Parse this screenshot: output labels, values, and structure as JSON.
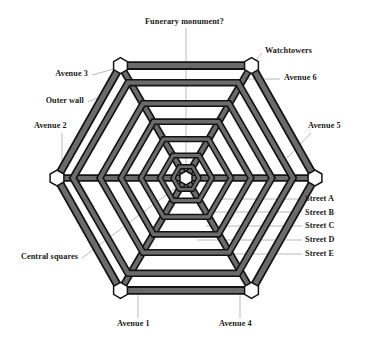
{
  "figure": {
    "type": "radial-hexagonal-city-plan",
    "background_color": "#ffffff",
    "road_fill_color": "#666666",
    "road_edge_color": "#1a1a1a",
    "node_fill_color": "#ffffff",
    "node_edge_color": "#1a1a1a",
    "leader_line_color": "#9a9a9a",
    "text_color": "#1a1a1a"
  },
  "geometry": {
    "center_x": 186,
    "center_y": 178,
    "outer_radius": 129,
    "ring_count": 6,
    "avenue_count": 6,
    "ring_radii": [
      129,
      107,
      86,
      65,
      45,
      26,
      11
    ]
  },
  "labels": {
    "funerary_monument": "Funerary monument?",
    "watchtowers": "Watchtowers",
    "avenue_6": "Avenue 6",
    "avenue_5": "Avenue 5",
    "avenue_3": "Avenue 3",
    "outer_wall": "Outer wall",
    "avenue_2": "Avenue 2",
    "central_squares": "Central squares",
    "avenue_1": "Avenue 1",
    "avenue_4": "Avenue 4",
    "street_a": "Street A",
    "street_b": "Street B",
    "street_c": "Street C",
    "street_d": "Street D",
    "street_e": "Street E"
  },
  "streets": [
    {
      "key": "street_a",
      "label": "Street A"
    },
    {
      "key": "street_b",
      "label": "Street B"
    },
    {
      "key": "street_c",
      "label": "Street C"
    },
    {
      "key": "street_d",
      "label": "Street D"
    },
    {
      "key": "street_e",
      "label": "Street E"
    }
  ],
  "avenues": [
    {
      "key": "avenue_1",
      "label": "Avenue 1"
    },
    {
      "key": "avenue_2",
      "label": "Avenue 2"
    },
    {
      "key": "avenue_3",
      "label": "Avenue 3"
    },
    {
      "key": "avenue_4",
      "label": "Avenue 4"
    },
    {
      "key": "avenue_5",
      "label": "Avenue 5"
    },
    {
      "key": "avenue_6",
      "label": "Avenue 6"
    }
  ],
  "nodes": [
    {
      "key": "watchtowers",
      "label": "Watchtowers"
    },
    {
      "key": "central_squares",
      "label": "Central squares"
    },
    {
      "key": "outer_wall",
      "label": "Outer wall"
    },
    {
      "key": "funerary_monument",
      "label": "Funerary monument?"
    }
  ]
}
